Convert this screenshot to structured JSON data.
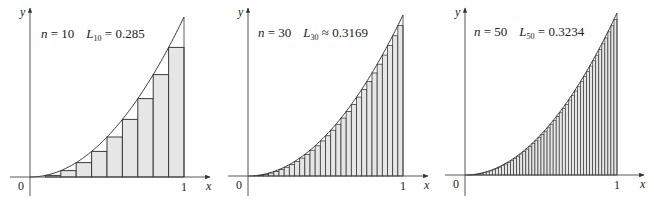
{
  "colors": {
    "rect_fill": "#e6e6e6",
    "rect_stroke": "#3a3a3a",
    "curve": "#3a3a3a",
    "axis": "#444444"
  },
  "chart_data": [
    {
      "type": "bar",
      "function": "x^2",
      "interval": [
        0,
        1
      ],
      "method": "left endpoint",
      "n": 10,
      "annotation": {
        "n_label": "n",
        "n_eq": " = 10",
        "L_label": "L",
        "L_sub": "10",
        "L_rel": " = ",
        "L_value": "0.285"
      },
      "xlabel": "x",
      "ylabel": "y",
      "x_ticks": [
        "0",
        "1"
      ],
      "xlim": [
        0,
        1
      ],
      "ylim": [
        0,
        1
      ],
      "sum": 0.285
    },
    {
      "type": "bar",
      "function": "x^2",
      "interval": [
        0,
        1
      ],
      "method": "left endpoint",
      "n": 30,
      "annotation": {
        "n_label": "n",
        "n_eq": " = 30",
        "L_label": "L",
        "L_sub": "30",
        "L_rel": " ≈ ",
        "L_value": "0.3169"
      },
      "xlabel": "x",
      "ylabel": "y",
      "x_ticks": [
        "0",
        "1"
      ],
      "xlim": [
        0,
        1
      ],
      "ylim": [
        0,
        1
      ],
      "sum": 0.3169
    },
    {
      "type": "bar",
      "function": "x^2",
      "interval": [
        0,
        1
      ],
      "method": "left endpoint",
      "n": 50,
      "annotation": {
        "n_label": "n",
        "n_eq": " = 50",
        "L_label": "L",
        "L_sub": "50",
        "L_rel": " = ",
        "L_value": "0.3234"
      },
      "xlabel": "x",
      "ylabel": "y",
      "x_ticks": [
        "0",
        "1"
      ],
      "xlim": [
        0,
        1
      ],
      "ylim": [
        0,
        1
      ],
      "sum": 0.3234
    }
  ],
  "layout": [
    {
      "ox": 30,
      "oy": 177,
      "x1": 184,
      "ytop": 17,
      "axisLeft": 10,
      "axisRight": 210,
      "axisTop": 8,
      "axisBottom": 196,
      "labelX": 41,
      "labelY": 38
    },
    {
      "ox": 248,
      "oy": 176,
      "x1": 403,
      "ytop": 15,
      "axisLeft": 228,
      "axisRight": 428,
      "axisTop": 8,
      "axisBottom": 196,
      "labelX": 258,
      "labelY": 37
    },
    {
      "ox": 465,
      "oy": 175,
      "x1": 617,
      "ytop": 13,
      "axisLeft": 445,
      "axisRight": 644,
      "axisTop": 8,
      "axisBottom": 196,
      "labelX": 474,
      "labelY": 36
    }
  ]
}
